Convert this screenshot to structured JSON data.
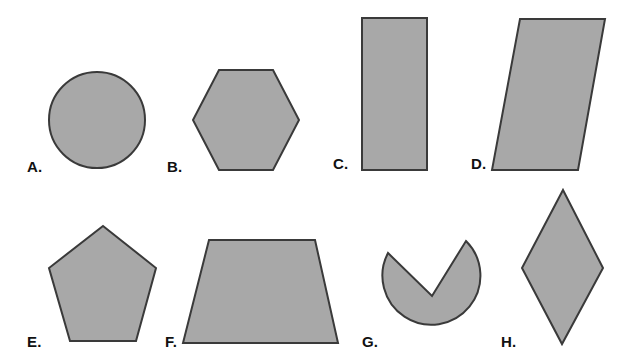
{
  "figure": {
    "background_color": "#ffffff",
    "width": 635,
    "height": 360,
    "shape_fill_color": "#a8a8a8",
    "shape_stroke_color": "#3a3a3a",
    "label_color": "#111111"
  },
  "shapes": [
    {
      "id": "a",
      "label": "A.",
      "name": "circle",
      "icon": "circle-shape",
      "label_x": 27,
      "label_y": 159,
      "geometry": {
        "kind": "circle",
        "cx": 97,
        "cy": 120,
        "r": 48
      }
    },
    {
      "id": "b",
      "label": "B.",
      "name": "hexagon",
      "icon": "hexagon-shape",
      "label_x": 167,
      "label_y": 159,
      "geometry": {
        "kind": "polygon",
        "points": "219,70 273,70 299,120 273,170 219,170 193,120"
      }
    },
    {
      "id": "c",
      "label": "C.",
      "name": "rectangle",
      "icon": "rectangle-shape",
      "label_x": 333,
      "label_y": 156,
      "geometry": {
        "kind": "polygon",
        "points": "362,18 427,18 427,170 362,170"
      }
    },
    {
      "id": "d",
      "label": "D.",
      "name": "parallelogram",
      "icon": "parallelogram-shape",
      "label_x": 471,
      "label_y": 156,
      "geometry": {
        "kind": "polygon",
        "points": "520,19 605,19 578,170 492,170"
      }
    },
    {
      "id": "e",
      "label": "E.",
      "name": "pentagon",
      "icon": "pentagon-shape",
      "label_x": 27,
      "label_y": 334,
      "geometry": {
        "kind": "polygon",
        "points": "103,226 156,268 136,341 70,341 49,268"
      }
    },
    {
      "id": "f",
      "label": "F.",
      "name": "trapezoid",
      "icon": "trapezoid-shape",
      "label_x": 165,
      "label_y": 334,
      "geometry": {
        "kind": "polygon",
        "points": "209,240 315,240 338,343 183,343"
      }
    },
    {
      "id": "g",
      "label": "G.",
      "name": "circle-sector-cutout",
      "icon": "pacman-shape",
      "label_x": 362,
      "label_y": 334,
      "geometry": {
        "kind": "path",
        "d": "M 432 296 L 466 241 A 49 49 0 1 1 388 253 Z"
      }
    },
    {
      "id": "h",
      "label": "H.",
      "name": "rhombus",
      "icon": "rhombus-shape",
      "label_x": 501,
      "label_y": 334,
      "geometry": {
        "kind": "polygon",
        "points": "563,190 603,268 562,344 522,268"
      }
    }
  ]
}
